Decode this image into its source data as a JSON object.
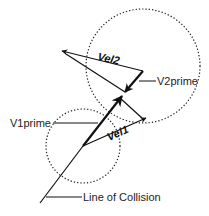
{
  "diagram": {
    "type": "collision-vector-diagram",
    "labels": {
      "vel1": "Vel1",
      "vel2": "Vel2",
      "v1prime": "V1prime",
      "v2prime": "V2prime",
      "line_of_collision": "Line of Collision"
    },
    "colors": {
      "stroke": "#111111",
      "circle": "#222222",
      "background": "#ffffff"
    },
    "circles": [
      {
        "name": "ball-2-outline",
        "cx": 143,
        "cy": 66,
        "r": 57,
        "style": "dotted"
      },
      {
        "name": "ball-1-outline",
        "cx": 83,
        "cy": 146,
        "r": 37,
        "style": "dotted"
      }
    ]
  }
}
